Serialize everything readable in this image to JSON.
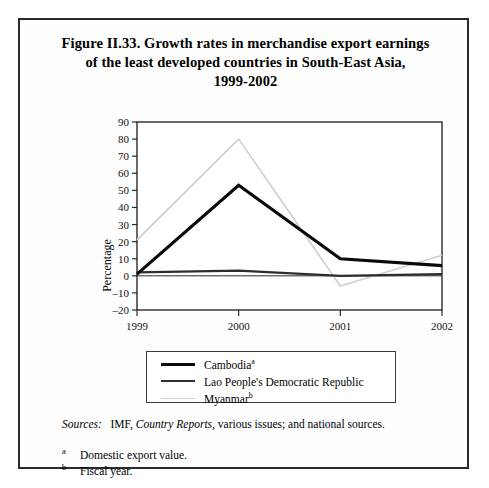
{
  "figure": {
    "title_lines": [
      "Figure II.33.  Growth rates in merchandise export earnings",
      "of the least developed countries in South-East Asia,",
      "1999-2002"
    ],
    "ylabel": "Percentage"
  },
  "legend": {
    "items": [
      {
        "label": "Cambodia",
        "sup": "a",
        "color": "#0a0a0a",
        "width": 3.2,
        "swatch": "sw-cam"
      },
      {
        "label": "Lao People's Democratic Republic",
        "sup": "",
        "color": "#2e2e2e",
        "width": 2.2,
        "swatch": "sw-lao"
      },
      {
        "label": "Myanmar",
        "sup": "b",
        "color": "#cfcfcf",
        "width": 1.6,
        "swatch": "sw-mya"
      }
    ]
  },
  "sources": {
    "label": "Sources:",
    "text_1": "IMF, ",
    "italic_work": "Country Reports",
    "text_2": ", various issues; and national sources."
  },
  "footnotes": [
    {
      "mark": "a",
      "text": "Domestic export value."
    },
    {
      "mark": "b",
      "text": "Fiscal year."
    }
  ],
  "chart_data": {
    "type": "line",
    "title": "Figure II.33. Growth rates in merchandise export earnings of the least developed countries in South-East Asia, 1999-2002",
    "xlabel": "",
    "ylabel": "Percentage",
    "x": [
      "1999",
      "2000",
      "2001",
      "2002"
    ],
    "categories": [
      "1999",
      "2000",
      "2001",
      "2002"
    ],
    "ylim": [
      -20,
      90
    ],
    "yticks": [
      -20,
      -10,
      0,
      10,
      20,
      30,
      40,
      50,
      60,
      70,
      80,
      90
    ],
    "grid": false,
    "legend_position": "below-plot",
    "series": [
      {
        "name": "Cambodia",
        "values": [
          1,
          53,
          10,
          6
        ],
        "color": "#0a0a0a",
        "width": 3.2
      },
      {
        "name": "Lao People's Democratic Republic",
        "values": [
          2,
          3,
          0,
          1
        ],
        "color": "#2e2e2e",
        "width": 2.2
      },
      {
        "name": "Myanmar",
        "values": [
          21,
          80,
          -6,
          12
        ],
        "color": "#cfcfcf",
        "width": 1.6
      }
    ]
  }
}
